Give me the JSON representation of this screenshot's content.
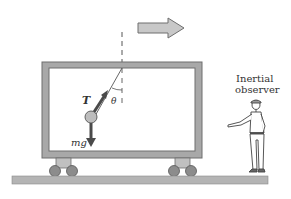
{
  "diagram": {
    "type": "physics-free-body",
    "labels": {
      "tension": "T",
      "angle": "θ",
      "weight": "mg",
      "observer_line1": "Inertial",
      "observer_line2": "observer"
    },
    "colors": {
      "frame": "#a8a8a8",
      "frame_edge": "#6e6e6e",
      "ground": "#b4b4b4",
      "arrow_fill": "#c8c8c8",
      "vector": "#4a4a4a",
      "bob": "#bdbdbd",
      "wheel": "#8c8c8c"
    }
  }
}
